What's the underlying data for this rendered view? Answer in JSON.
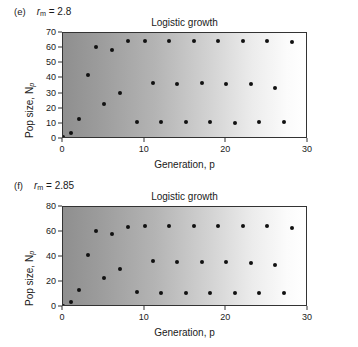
{
  "figure": {
    "panels": [
      {
        "letter": "(e)",
        "param_symbol": "r",
        "param_sub": "m",
        "param_eq": "= 2.8",
        "chart_data": {
          "type": "scatter",
          "title": "Logistic growth",
          "xlabel": "Generation, p",
          "ylabel": "Pop size, N",
          "ylabel_sub": "p",
          "xlim": [
            0,
            30
          ],
          "ylim": [
            0,
            70
          ],
          "xticks": [
            0,
            10,
            20,
            30
          ],
          "yticks": [
            0,
            10,
            20,
            30,
            40,
            50,
            60,
            70
          ],
          "grid": false,
          "legend": "none",
          "x": [
            0,
            1,
            2,
            3,
            4,
            5,
            6,
            7,
            8,
            9,
            10,
            11,
            12,
            13,
            14,
            15,
            16,
            17,
            18,
            19,
            20,
            21,
            22,
            23,
            24,
            25,
            26,
            27,
            28
          ],
          "y": [
            1,
            4,
            13.5,
            42,
            61,
            23,
            58.5,
            30.5,
            65,
            11.5,
            65,
            37,
            11,
            65,
            36,
            11,
            65,
            37,
            11,
            65,
            36,
            10.5,
            65,
            36,
            11,
            65,
            34,
            11,
            64
          ]
        }
      },
      {
        "letter": "(f)",
        "param_symbol": "r",
        "param_sub": "m",
        "param_eq": "= 2.85",
        "chart_data": {
          "type": "scatter",
          "title": "Logistic growth",
          "xlabel": "Generation, p",
          "ylabel": "Pop size, N",
          "ylabel_sub": "p",
          "xlim": [
            0,
            30
          ],
          "ylim": [
            0,
            80
          ],
          "xticks": [
            0,
            10,
            20,
            30
          ],
          "yticks": [
            0,
            20,
            40,
            60,
            80
          ],
          "grid": false,
          "legend": "none",
          "x": [
            0,
            1,
            2,
            3,
            4,
            5,
            6,
            7,
            8,
            9,
            10,
            11,
            12,
            13,
            14,
            15,
            16,
            17,
            18,
            19,
            20,
            21,
            22,
            23,
            24,
            25,
            26,
            27,
            28
          ],
          "y": [
            1,
            4,
            13.5,
            42,
            60.5,
            23,
            58.5,
            30.5,
            64,
            12,
            64.5,
            37,
            11,
            64.5,
            36,
            11,
            64.5,
            36,
            11,
            64.5,
            36,
            11,
            64.5,
            35,
            11,
            64.5,
            34,
            11,
            63
          ]
        }
      }
    ]
  },
  "colors": {
    "axis": "#333333",
    "dot": "#111111",
    "gradient_start": "#8f8f8f",
    "gradient_end": "#ffffff",
    "text": "#1a1a1a"
  }
}
